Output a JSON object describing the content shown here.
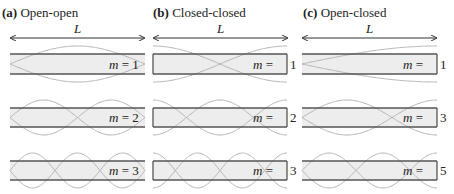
{
  "figure": {
    "panels": [
      {
        "id": "a",
        "tag": "(a)",
        "title": "Open-open",
        "length_label": "L",
        "ends": "open-open",
        "modes": [
          {
            "m_label": "m",
            "eq": "=",
            "value": "1"
          },
          {
            "m_label": "m",
            "eq": "=",
            "value": "2"
          },
          {
            "m_label": "m",
            "eq": "=",
            "value": "3"
          }
        ]
      },
      {
        "id": "b",
        "tag": "(b)",
        "title": "Closed-closed",
        "length_label": "L",
        "ends": "closed-closed",
        "modes": [
          {
            "m_label": "m",
            "eq": "=",
            "value": "1"
          },
          {
            "m_label": "m",
            "eq": "=",
            "value": "2"
          },
          {
            "m_label": "m",
            "eq": "=",
            "value": "3"
          }
        ]
      },
      {
        "id": "c",
        "tag": "(c)",
        "title": "Open-closed",
        "length_label": "L",
        "ends": "open-closed",
        "modes": [
          {
            "m_label": "m",
            "eq": "=",
            "value": "1"
          },
          {
            "m_label": "m",
            "eq": "=",
            "value": "3"
          },
          {
            "m_label": "m",
            "eq": "=",
            "value": "5"
          }
        ]
      }
    ],
    "colors": {
      "tube_line": "#555555",
      "tube_fill": "#ededed",
      "wave": "#b5b5b5",
      "text": "#222222"
    }
  }
}
